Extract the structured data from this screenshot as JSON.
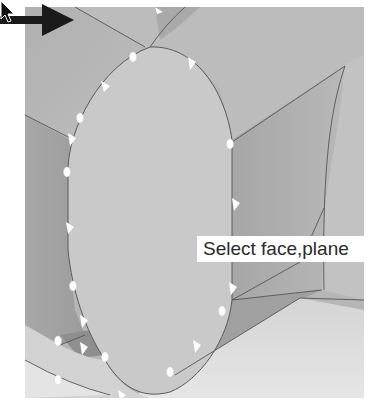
{
  "viewport": {
    "description": "3D CAD model view, face selection mode",
    "background": "#ffffff",
    "model_shade_light": "#cfcfcf",
    "model_shade_mid": "#b4b4b4",
    "model_shade_dark": "#9a9a9a",
    "selected_face_color": "#c8c8c8",
    "edge_color": "#555555",
    "handle_color": "#ffffff"
  },
  "annotation": {
    "arrow_icon": "arrow-right-icon",
    "arrow_color": "#1a1a1a"
  },
  "cursor": {
    "icon": "mouse-pointer-icon"
  },
  "tooltip": {
    "text": "Select face,plane"
  }
}
